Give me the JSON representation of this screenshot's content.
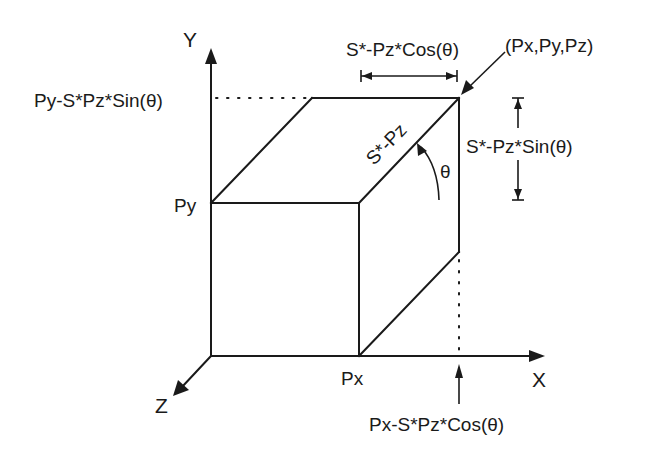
{
  "diagram": {
    "axes": {
      "x_label": "X",
      "y_label": "Y",
      "z_label": "Z"
    },
    "labels": {
      "point": "(Px,Py,Pz)",
      "py": "Py",
      "px": "Px",
      "py_projected": "Py-S*Pz*Sin(θ)",
      "px_projected": "Px-S*Pz*Cos(θ)",
      "horizontal_offset": "S*-Pz*Cos(θ)",
      "vertical_offset": "S*-Pz*Sin(θ)",
      "depth_length": "S*-Pz",
      "angle": "θ"
    },
    "colors": {
      "line": "#1a1a1a",
      "background": "#ffffff"
    }
  }
}
